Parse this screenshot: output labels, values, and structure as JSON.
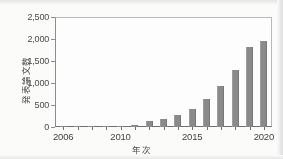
{
  "chart_data": {
    "type": "bar",
    "title": "",
    "xlabel": "年次",
    "ylabel": "発表論文数",
    "categories": [
      "2006",
      "2007",
      "2008",
      "2009",
      "2010",
      "2011",
      "2012",
      "2013",
      "2014",
      "2015",
      "2016",
      "2017",
      "2018",
      "2019",
      "2020"
    ],
    "values": [
      15,
      20,
      25,
      25,
      30,
      55,
      130,
      190,
      280,
      420,
      640,
      940,
      1300,
      1830,
      1980
    ],
    "ylim": [
      0,
      2500
    ],
    "ytick_values": [
      0,
      500,
      1000,
      1500,
      2000,
      2500
    ],
    "ytick_labels": [
      "0",
      "500",
      "1,000",
      "1,500",
      "2,000",
      "2,500"
    ],
    "xtick_labels": [
      "2006",
      "2010",
      "2015",
      "2020"
    ],
    "xtick_categories": [
      "2006",
      "2010",
      "2015",
      "2020"
    ],
    "grid": false,
    "legend": false,
    "bar_color": "#8a8a8a",
    "axis_color": "#6f6f6f",
    "text_color": "#3f3f3f",
    "background": "#fdfdfc"
  }
}
